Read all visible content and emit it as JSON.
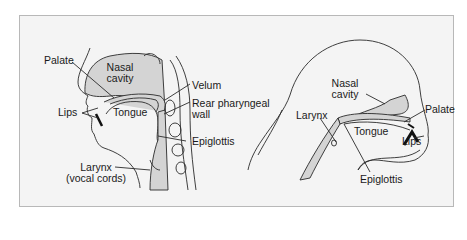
{
  "figure": {
    "background": "#f4f4f4",
    "border_color": "#b8b8b8",
    "tissue_fill": "#d4d4d4",
    "line_color": "#2a2a2a"
  },
  "left_diagram": {
    "view": "human vocal tract sagittal section",
    "labels": {
      "palate": "Palate",
      "nasal_cavity_1": "Nasal",
      "nasal_cavity_2": "cavity",
      "velum": "Velum",
      "lips": "Lips",
      "tongue": "Tongue",
      "rear_pharyngeal_1": "Rear pharyngeal",
      "rear_pharyngeal_2": "wall",
      "epiglottis": "Epiglottis",
      "larynx_1": "Larynx",
      "larynx_2": "(vocal cords)"
    }
  },
  "right_diagram": {
    "view": "chimpanzee vocal tract sagittal section",
    "labels": {
      "nasal_cavity_1": "Nasal",
      "nasal_cavity_2": "cavity",
      "palate": "Palate",
      "larynx": "Larynx",
      "tongue": "Tongue",
      "lips": "Lips",
      "epiglottis": "Epiglottis"
    }
  }
}
